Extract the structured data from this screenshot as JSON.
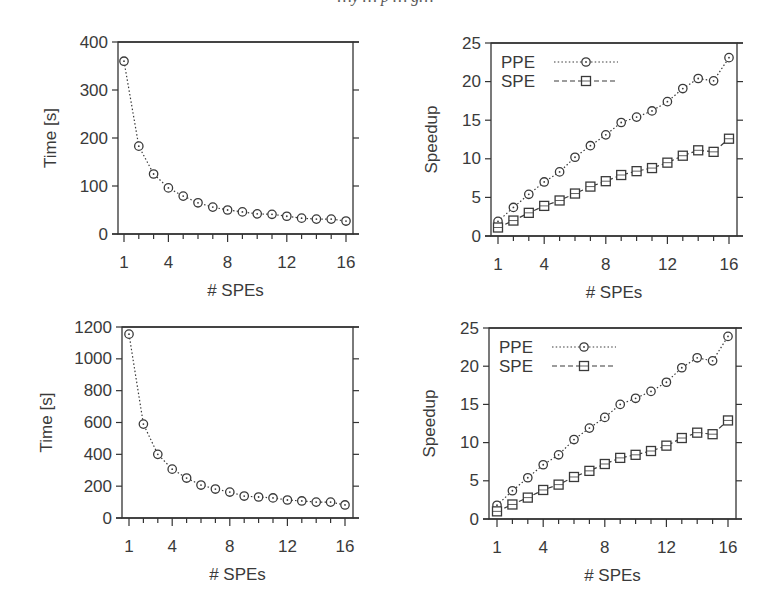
{
  "figure": {
    "top_caption_fragment": "…y … p … g…"
  },
  "chart_data": [
    {
      "id": "top-left",
      "type": "line",
      "title": "",
      "xlabel": "# SPEs",
      "ylabel": "Time [s]",
      "xlim": [
        0.6,
        16.6
      ],
      "ylim": [
        0,
        400
      ],
      "xticks": [
        1,
        4,
        8,
        12,
        16
      ],
      "xminor_ticks": [
        1,
        2,
        3,
        4,
        5,
        6,
        7,
        8,
        9,
        10,
        11,
        12,
        13,
        14,
        15,
        16
      ],
      "yticks": [
        0,
        100,
        200,
        300,
        400
      ],
      "grid": false,
      "legend": null,
      "x": [
        1,
        2,
        3,
        4,
        5,
        6,
        7,
        8,
        9,
        10,
        11,
        12,
        13,
        14,
        15,
        16
      ],
      "series": [
        {
          "name": "Time",
          "marker": "circle",
          "line": "dotted",
          "values": [
            360,
            183,
            125,
            96,
            79,
            65,
            56,
            50,
            46,
            42,
            41,
            37,
            33,
            31,
            31,
            27
          ]
        }
      ],
      "box": {
        "left": 118,
        "top": 42,
        "right": 353,
        "bottom": 234,
        "x1px": 124,
        "x16px": 346
      }
    },
    {
      "id": "top-right",
      "type": "line",
      "title": "",
      "xlabel": "# SPEs",
      "ylabel": "Speedup",
      "xlim": [
        0.6,
        16.6
      ],
      "ylim": [
        0,
        25
      ],
      "xticks": [
        1,
        4,
        8,
        12,
        16
      ],
      "xminor_ticks": [
        1,
        2,
        3,
        4,
        5,
        6,
        7,
        8,
        9,
        10,
        11,
        12,
        13,
        14,
        15,
        16
      ],
      "yticks": [
        0,
        5,
        10,
        15,
        20,
        25
      ],
      "grid": false,
      "legend": {
        "position": "top-left",
        "entries": [
          "PPE",
          "SPE"
        ]
      },
      "x": [
        1,
        2,
        3,
        4,
        5,
        6,
        7,
        8,
        9,
        10,
        11,
        12,
        13,
        14,
        15,
        16
      ],
      "series": [
        {
          "name": "PPE",
          "marker": "circle",
          "line": "dotted",
          "values": [
            1.9,
            3.7,
            5.4,
            7.0,
            8.3,
            10.2,
            11.7,
            13.1,
            14.7,
            15.4,
            16.2,
            17.4,
            19.1,
            20.4,
            20.1,
            23.1
          ]
        },
        {
          "name": "SPE",
          "marker": "square",
          "line": "dashed",
          "values": [
            1.1,
            2.0,
            3.0,
            3.9,
            4.6,
            5.5,
            6.4,
            7.1,
            7.9,
            8.4,
            8.8,
            9.5,
            10.4,
            11.1,
            10.9,
            12.6
          ]
        }
      ],
      "box": {
        "left": 491,
        "top": 43,
        "right": 737,
        "bottom": 236,
        "x1px": 498,
        "x16px": 729
      }
    },
    {
      "id": "bottom-left",
      "type": "line",
      "title": "",
      "xlabel": "# SPEs",
      "ylabel": "Time [s]",
      "xlim": [
        0.6,
        16.6
      ],
      "ylim": [
        0,
        1200
      ],
      "xticks": [
        1,
        4,
        8,
        12,
        16
      ],
      "xminor_ticks": [
        1,
        2,
        3,
        4,
        5,
        6,
        7,
        8,
        9,
        10,
        11,
        12,
        13,
        14,
        15,
        16
      ],
      "yticks": [
        0,
        200,
        400,
        600,
        800,
        1000,
        1200
      ],
      "grid": false,
      "legend": null,
      "x": [
        1,
        2,
        3,
        4,
        5,
        6,
        7,
        8,
        9,
        10,
        11,
        12,
        13,
        14,
        15,
        16
      ],
      "series": [
        {
          "name": "Time",
          "marker": "circle",
          "line": "dotted",
          "values": [
            1155,
            590,
            400,
            307,
            251,
            207,
            182,
            163,
            138,
            132,
            126,
            113,
            107,
            100,
            100,
            82
          ]
        }
      ],
      "box": {
        "left": 122,
        "top": 327,
        "right": 353,
        "bottom": 518,
        "x1px": 129,
        "x16px": 345
      }
    },
    {
      "id": "bottom-right",
      "type": "line",
      "title": "",
      "xlabel": "# SPEs",
      "ylabel": "Speedup",
      "xlim": [
        0.6,
        16.6
      ],
      "ylim": [
        0,
        25
      ],
      "xticks": [
        1,
        4,
        8,
        12,
        16
      ],
      "xminor_ticks": [
        1,
        2,
        3,
        4,
        5,
        6,
        7,
        8,
        9,
        10,
        11,
        12,
        13,
        14,
        15,
        16
      ],
      "yticks": [
        0,
        5,
        10,
        15,
        20,
        25
      ],
      "grid": false,
      "legend": {
        "position": "top-left",
        "entries": [
          "PPE",
          "SPE"
        ]
      },
      "x": [
        1,
        2,
        3,
        4,
        5,
        6,
        7,
        8,
        9,
        10,
        11,
        12,
        13,
        14,
        15,
        16
      ],
      "series": [
        {
          "name": "PPE",
          "marker": "circle",
          "line": "dotted",
          "values": [
            1.8,
            3.7,
            5.4,
            7.1,
            8.4,
            10.4,
            11.9,
            13.3,
            15.0,
            15.8,
            16.7,
            17.9,
            19.8,
            21.1,
            20.7,
            23.9
          ]
        },
        {
          "name": "SPE",
          "marker": "square",
          "line": "dashed",
          "values": [
            1.0,
            1.9,
            2.8,
            3.8,
            4.5,
            5.5,
            6.3,
            7.2,
            8.0,
            8.4,
            8.9,
            9.6,
            10.6,
            11.3,
            11.1,
            12.9
          ]
        }
      ],
      "box": {
        "left": 489,
        "top": 328,
        "right": 736,
        "bottom": 519,
        "x1px": 497,
        "x16px": 728
      }
    }
  ],
  "style": {
    "axis_color": "#333333",
    "series_color": "#3a3a3a",
    "text_color": "#3a3a3a",
    "background": "#ffffff"
  }
}
